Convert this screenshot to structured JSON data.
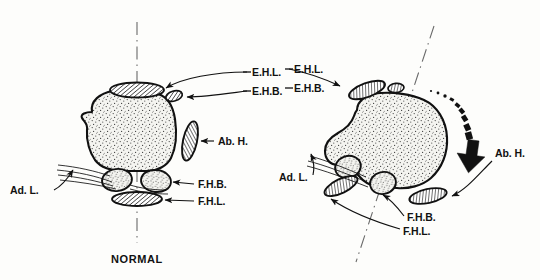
{
  "figure": {
    "title_bottom": "NORMAL",
    "background_color": "#fdfdfb",
    "ink_color": "#111111",
    "bone_fill_color": "#f2f2ee",
    "stipple_color": "#3a3a3a"
  },
  "left_panel": {
    "name": "normal-foot-cross-section",
    "caption": "NORMAL",
    "axis_label": "vertical-dash-dot-axis",
    "labels": {
      "ehl": "E.H.L.",
      "ehb": "E.H.B.",
      "abh": "Ab. H.",
      "fhb": "F.H.B.",
      "fhl": "F.H.L.",
      "adl": "Ad. L."
    },
    "structures": [
      {
        "name": "extensor-hallucis-longus",
        "abbrev": "E.H.L.",
        "style": "hatched-ellipse",
        "position": "superior"
      },
      {
        "name": "extensor-hallucis-brevis",
        "abbrev": "E.H.B.",
        "style": "hatched-small-ellipse",
        "position": "superior-lateral"
      },
      {
        "name": "abductor-hallucis",
        "abbrev": "Ab. H.",
        "style": "hatched-ellipse",
        "position": "lateral"
      },
      {
        "name": "flexor-hallucis-brevis",
        "abbrev": "F.H.B.",
        "style": "stippled-sesamoid",
        "position": "inferior"
      },
      {
        "name": "flexor-hallucis-longus",
        "abbrev": "F.H.L.",
        "style": "hatched-ellipse",
        "position": "inferior"
      },
      {
        "name": "adductor-hallucis",
        "abbrev": "Ad. L.",
        "style": "tendon-lines",
        "position": "medial-inferior"
      },
      {
        "name": "metatarsal-head",
        "abbrev": "",
        "style": "stippled-bone",
        "position": "center"
      }
    ]
  },
  "right_panel": {
    "name": "hallux-valgus-foot-cross-section",
    "caption": "",
    "axis_label": "tilted-dash-dot-axis",
    "labels": {
      "ehl": "E.H.L.",
      "ehb": "E.H.B.",
      "abh": "Ab. H.",
      "fhb": "F.H.B.",
      "fhl": "F.H.L.",
      "adl": "Ad. L."
    },
    "rotation_arrow": {
      "name": "pronation-rotation-arrow",
      "style": "dotted-to-solid-curved-arrow",
      "direction": "clockwise-downward"
    },
    "structures": [
      {
        "name": "extensor-hallucis-longus",
        "abbrev": "E.H.L.",
        "style": "hatched-ellipse",
        "position": "superior-medial"
      },
      {
        "name": "extensor-hallucis-brevis",
        "abbrev": "E.H.B.",
        "style": "hatched-small-ellipse",
        "position": "superior"
      },
      {
        "name": "abductor-hallucis",
        "abbrev": "Ab. H.",
        "style": "hatched-ellipse",
        "position": "inferior-lateral"
      },
      {
        "name": "flexor-hallucis-brevis",
        "abbrev": "F.H.B.",
        "style": "stippled-sesamoid",
        "position": "medial-inferior"
      },
      {
        "name": "flexor-hallucis-longus",
        "abbrev": "F.H.L.",
        "style": "hatched-ellipse",
        "position": "medial-inferior"
      },
      {
        "name": "adductor-hallucis",
        "abbrev": "Ad. L.",
        "style": "tendon-lines",
        "position": "medial"
      },
      {
        "name": "metatarsal-head",
        "abbrev": "",
        "style": "stippled-bone",
        "position": "center"
      }
    ]
  }
}
